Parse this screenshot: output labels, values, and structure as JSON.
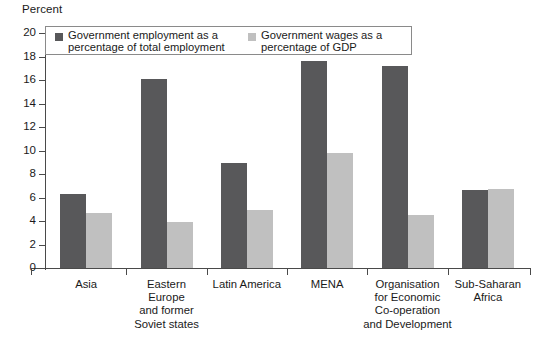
{
  "chart_data": {
    "type": "bar",
    "title": "",
    "subtitle": "",
    "xlabel": "",
    "ylabel": "Percent",
    "ylim": [
      0,
      20
    ],
    "yticks": [
      0,
      2,
      4,
      6,
      8,
      10,
      12,
      14,
      16,
      18,
      20
    ],
    "grid": false,
    "legend_position": "top-left-inside",
    "categories": [
      "Asia",
      "Eastern\nEurope\nand former\nSoviet states",
      "Latin America",
      "MENA",
      "Organisation\nfor Economic\nCo-operation\nand Development",
      "Sub-Saharan\nAfrica"
    ],
    "series": [
      {
        "name": "Government employment as a\npercentage of total employment",
        "color": "#58585a",
        "values": [
          6.3,
          16.1,
          8.9,
          17.6,
          17.2,
          6.6
        ]
      },
      {
        "name": "Government wages as a\npercentage of GDP",
        "color": "#c0c0c0",
        "values": [
          4.7,
          3.9,
          4.9,
          9.8,
          4.5,
          6.75
        ]
      }
    ]
  },
  "colors": {
    "series_dark": "#58585a",
    "series_light": "#c0c0c0",
    "axis": "#4a4a4a",
    "legend_border": "#8a8a8a",
    "background": "#ffffff"
  }
}
